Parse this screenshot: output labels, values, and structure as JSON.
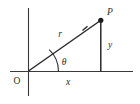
{
  "diagram": {
    "background_color": "#ffffff",
    "stroke_color": "#2b2b2b",
    "axis_color": "#3a3a3a",
    "labels": {
      "origin": "O",
      "point": "P",
      "radius": "r",
      "angle": "θ",
      "horizontal_component": "x",
      "vertical_component": "y"
    },
    "geometry": {
      "origin_px": [
        28,
        71
      ],
      "point_px": [
        101,
        20
      ],
      "x_axis_px": [
        10,
        71,
        133,
        71
      ],
      "y_axis_px": [
        28,
        8,
        28,
        96
      ],
      "arc_radius_px": 30
    }
  }
}
